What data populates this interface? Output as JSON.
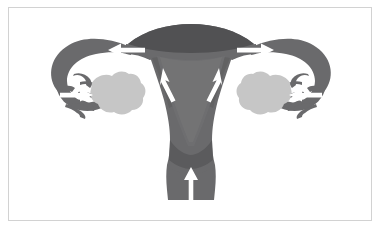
{
  "figure": {
    "title": "Female reproductive tract flow diagram",
    "background_color": "#ffffff",
    "frame_color": "#d2d2d2"
  },
  "colors": {
    "organ_dark": "#6a6a6c",
    "organ_mid": "#5b5b5d",
    "fundus_dark": "#515153",
    "cavity_light": "#f2f2f2",
    "ovary": "#c6c6c6",
    "arrow": "#ffffff",
    "arrow_outline": "#e8e8e8"
  },
  "structures": [
    {
      "id": "uterus-fundus",
      "label": "Uterine fundus",
      "side": "center"
    },
    {
      "id": "uterus-body",
      "label": "Uterine body (corpus)",
      "side": "center"
    },
    {
      "id": "endometrial-cavity",
      "label": "Endometrial cavity",
      "side": "center"
    },
    {
      "id": "cervix",
      "label": "Cervix",
      "side": "center"
    },
    {
      "id": "vaginal-canal",
      "label": "Vaginal canal",
      "side": "center"
    },
    {
      "id": "fallopian-tube-left",
      "label": "Left fallopian tube",
      "side": "left"
    },
    {
      "id": "fallopian-tube-right",
      "label": "Right fallopian tube",
      "side": "right"
    },
    {
      "id": "fimbriae-left",
      "label": "Left fimbriae",
      "side": "left"
    },
    {
      "id": "fimbriae-right",
      "label": "Right fimbriae",
      "side": "right"
    },
    {
      "id": "ovary-left",
      "label": "Left ovary",
      "side": "left"
    },
    {
      "id": "ovary-right",
      "label": "Right ovary",
      "side": "right"
    }
  ],
  "arrows": [
    {
      "id": "arrow-vaginal-up",
      "label": "Upward flow in vaginal canal",
      "direction": "up",
      "x": 191,
      "y": 182
    },
    {
      "id": "arrow-body-left-up",
      "label": "Upward flow left side of body",
      "direction": "up-left",
      "x": 168,
      "y": 83
    },
    {
      "id": "arrow-body-right-up",
      "label": "Upward flow right side of body",
      "direction": "up-right",
      "x": 214,
      "y": 83
    },
    {
      "id": "arrow-cornu-left",
      "label": "Outward flow to left fallopian tube",
      "direction": "left",
      "x": 122,
      "y": 52
    },
    {
      "id": "arrow-cornu-right",
      "label": "Outward flow to right fallopian tube",
      "direction": "right",
      "x": 260,
      "y": 52
    },
    {
      "id": "arrow-fimbriae-left",
      "label": "Flow toward left ovary",
      "direction": "right",
      "x": 80,
      "y": 95
    },
    {
      "id": "arrow-fimbriae-right",
      "label": "Flow toward right ovary",
      "direction": "left",
      "x": 302,
      "y": 95
    }
  ]
}
